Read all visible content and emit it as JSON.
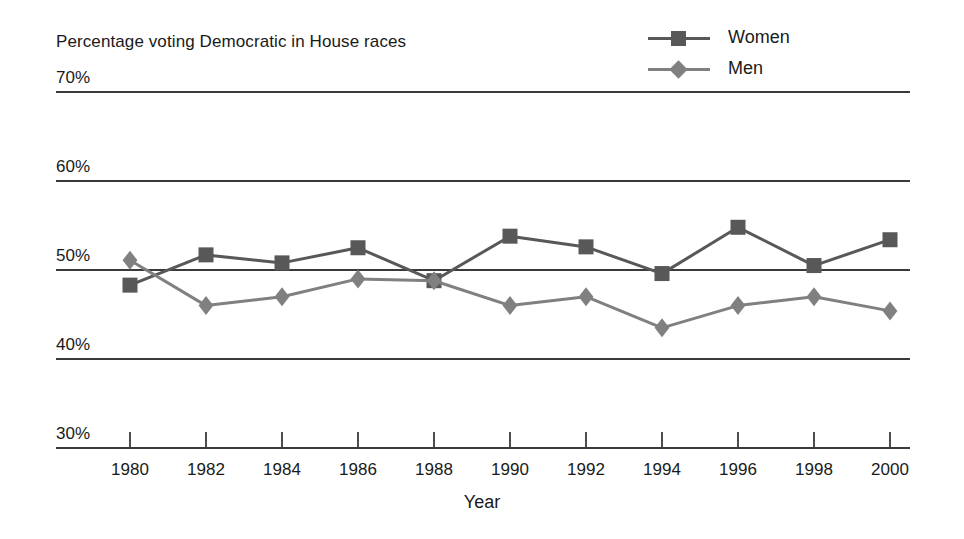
{
  "chart_data": {
    "type": "line",
    "title": "Percentage voting Democratic in House races",
    "xlabel": "Year",
    "ylabel": "",
    "categories": [
      1980,
      1982,
      1984,
      1986,
      1988,
      1990,
      1992,
      1994,
      1996,
      1998,
      2000
    ],
    "x_tick_labels": [
      "1980",
      "1982",
      "1984",
      "1986",
      "1988",
      "1990",
      "1992",
      "1994",
      "1996",
      "1998",
      "2000"
    ],
    "y_tick_labels": [
      "70%",
      "60%",
      "50%",
      "40%",
      "30%"
    ],
    "y_ticks": [
      70,
      60,
      50,
      40,
      30
    ],
    "ylim": [
      30,
      70
    ],
    "xlim": [
      1980,
      2000
    ],
    "grid": true,
    "grid_axis": "y",
    "legend_position": "top-right",
    "series": [
      {
        "name": "Women",
        "color": "#585858",
        "marker": "square",
        "values": [
          48.3,
          51.7,
          50.8,
          52.5,
          48.8,
          53.8,
          52.6,
          49.6,
          54.8,
          50.5,
          53.4
        ]
      },
      {
        "name": "Men",
        "color": "#808080",
        "marker": "diamond",
        "values": [
          51.1,
          46.0,
          47.0,
          49.0,
          48.8,
          46.0,
          47.0,
          43.5,
          46.0,
          47.0,
          45.4
        ]
      }
    ]
  },
  "legend": {
    "items": [
      {
        "label": "Women"
      },
      {
        "label": "Men"
      }
    ]
  },
  "axes": {
    "x_title": "Year"
  },
  "colors": {
    "women": "#585858",
    "men": "#808080",
    "grid": "#3a3a3a",
    "text": "#1a1a1a",
    "background": "#ffffff"
  }
}
